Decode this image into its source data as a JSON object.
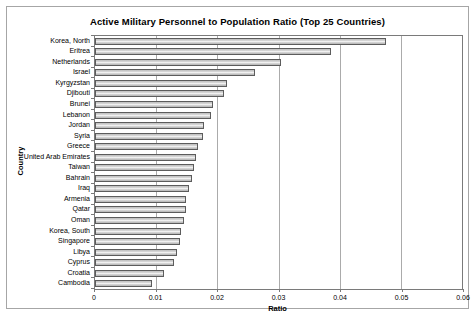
{
  "chart_data": {
    "type": "bar",
    "orientation": "horizontal",
    "title": "Active Military Personnel to Population Ratio (Top 25 Countries)",
    "xlabel": "Ratio",
    "ylabel": "Country",
    "xlim": [
      0,
      0.06
    ],
    "xticks": [
      0,
      0.01,
      0.02,
      0.03,
      0.04,
      0.05,
      0.06
    ],
    "xtick_labels": [
      "0",
      "0.01",
      "0.02",
      "0.03",
      "0.04",
      "0.05",
      "0.06"
    ],
    "grid": true,
    "legend": false,
    "categories": [
      "Korea, North",
      "Eritrea",
      "Netherlands",
      "Israel",
      "Kyrgyzstan",
      "Djibouti",
      "Brunei",
      "Lebanon",
      "Jordan",
      "Syria",
      "Greece",
      "United Arab Emirates",
      "Taiwan",
      "Bahrain",
      "Iraq",
      "Armenia",
      "Qatar",
      "Oman",
      "Korea, South",
      "Singapore",
      "Libya",
      "Cyprus",
      "Croatia",
      "Cambodia"
    ],
    "values": [
      0.0476,
      0.0386,
      0.0304,
      0.0262,
      0.0216,
      0.0211,
      0.0193,
      0.019,
      0.0178,
      0.0177,
      0.0169,
      0.0165,
      0.0162,
      0.0159,
      0.0154,
      0.0149,
      0.0148,
      0.0145,
      0.0141,
      0.0139,
      0.0134,
      0.0129,
      0.0113,
      0.0094
    ],
    "colors": {
      "bar_fill": "#cccccc",
      "bar_border": "#5c5c5c",
      "plot_border": "#7a7a7a",
      "gridline": "#ababab",
      "background": "#ffffff"
    }
  }
}
